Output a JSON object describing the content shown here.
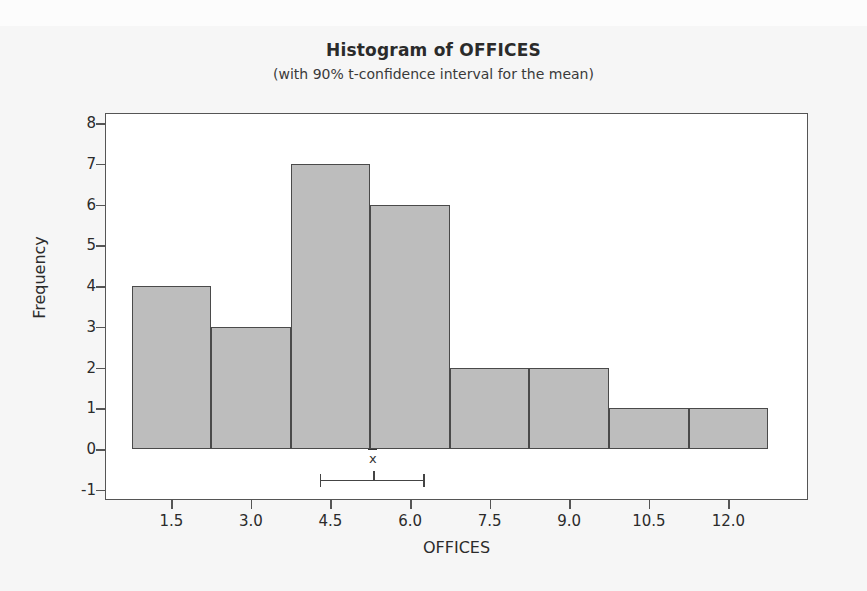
{
  "chart_data": {
    "type": "bar",
    "title": "Histogram of OFFICES",
    "subtitle": "(with 90% t-confidence interval for the mean)",
    "xlabel": "OFFICES",
    "ylabel": "Frequency",
    "bin_width": 1.5,
    "bin_edges": [
      0.75,
      2.25,
      3.75,
      5.25,
      6.75,
      8.25,
      9.75,
      11.25,
      12.75
    ],
    "bin_centers": [
      1.5,
      3.0,
      4.5,
      6.0,
      7.5,
      9.0,
      10.5,
      12.0
    ],
    "values": [
      4,
      3,
      7,
      6,
      2,
      2,
      1,
      1
    ],
    "categories": [
      "1.5",
      "3.0",
      "4.5",
      "6.0",
      "7.5",
      "9.0",
      "10.5",
      "12.0"
    ],
    "xticks": [
      1.5,
      3.0,
      4.5,
      6.0,
      7.5,
      9.0,
      10.5,
      12.0
    ],
    "xtick_labels": [
      "1.5",
      "3.0",
      "4.5",
      "6.0",
      "7.5",
      "9.0",
      "10.5",
      "12.0"
    ],
    "yticks": [
      -1,
      0,
      1,
      2,
      3,
      4,
      5,
      6,
      7,
      8
    ],
    "ytick_labels": [
      "-1",
      "0",
      "1",
      "2",
      "3",
      "4",
      "5",
      "6",
      "7",
      "8"
    ],
    "xlim": [
      0.25,
      13.5
    ],
    "ylim": [
      -1.25,
      8.25
    ],
    "grid": false,
    "legend": "none",
    "bar_fill_color": "#bdbdbd",
    "bar_edge_color": "#4a4a4a",
    "confidence_interval": {
      "label": "x̄",
      "confidence_level": "90%",
      "lower": 4.3,
      "mean": 5.3,
      "upper": 6.25,
      "y_position": -0.75
    }
  }
}
